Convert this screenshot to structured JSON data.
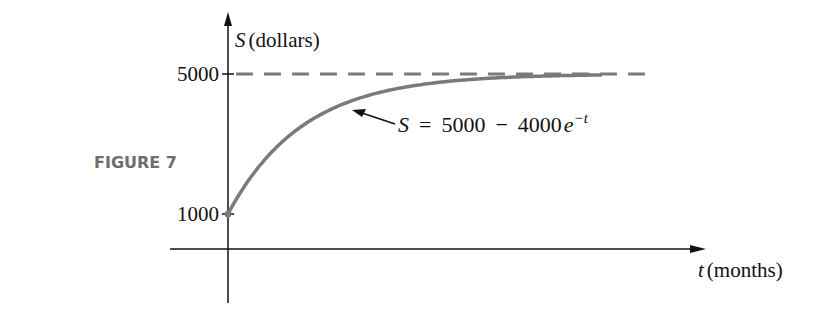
{
  "figure_label": "FIGURE 7",
  "chart_data": {
    "type": "line",
    "title": "",
    "xlabel_var": "t",
    "xlabel_unit": "(months)",
    "ylabel_var": "S",
    "ylabel_unit": "(dollars)",
    "xlim": [
      0,
      5
    ],
    "ylim": [
      0,
      5000
    ],
    "y_ticks": [
      {
        "value": 5000,
        "label": "5000"
      },
      {
        "value": 1000,
        "label": "1000"
      }
    ],
    "asymptote": {
      "value": 5000,
      "style": "dashed"
    },
    "series": [
      {
        "name": "S = 5000 - 4000e^-t",
        "formula": "5000 - 4000*exp(-t)",
        "t_start": 0,
        "t_end": 5,
        "sample_x": [
          0,
          0.5,
          1,
          2,
          3,
          4,
          5
        ],
        "sample_y": [
          1000,
          2574,
          3528,
          4459,
          4801,
          4927,
          4973
        ]
      }
    ],
    "annotation": {
      "S": "S",
      "eq": "=",
      "a": "5000",
      "minus": "−",
      "b": "4000",
      "e": "e",
      "exp": "−t",
      "points_to_t": 1.4
    },
    "colors": {
      "curve": "#7a7a7a",
      "axes": "#111111"
    }
  }
}
